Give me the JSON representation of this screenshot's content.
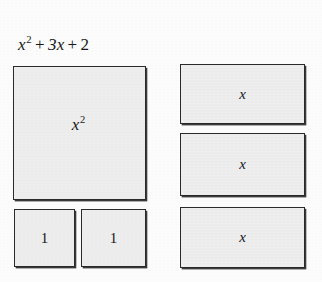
{
  "figure": {
    "title_expression": "x2 + 3x + 2",
    "title_parts": {
      "term_quadratic_base": "x",
      "term_quadratic_exponent": "2",
      "operator_1": "+",
      "term_linear": "3x",
      "operator_2": "+",
      "term_constant": "2"
    },
    "background_color": "#fdfdfd",
    "tile_fill_color": "#efefef",
    "tile_border_color": "#2a2a2a",
    "text_color": "#17181a"
  },
  "tiles": {
    "x_squared": {
      "label_base": "x",
      "label_exponent": "2",
      "count": 1
    },
    "unit": {
      "label": "1",
      "count": 2,
      "labels": [
        "1",
        "1"
      ]
    },
    "x": {
      "label": "x",
      "count": 3,
      "labels": [
        "x",
        "x",
        "x"
      ]
    }
  },
  "chart_data": {
    "type": "diagram",
    "representation": "algebra-tiles",
    "categories": [
      "x^2",
      "x",
      "1"
    ],
    "values": [
      1,
      3,
      2
    ],
    "series": [
      {
        "name": "tile counts",
        "values": [
          1,
          3,
          2
        ]
      }
    ],
    "tile_dimensions": {
      "x^2": {
        "width_units": "x",
        "height_units": "x"
      },
      "x": {
        "width_units": "x",
        "height_units": "1"
      },
      "1": {
        "width_units": "1",
        "height_units": "1"
      }
    },
    "xlabel": "",
    "ylabel": "",
    "legend": []
  }
}
